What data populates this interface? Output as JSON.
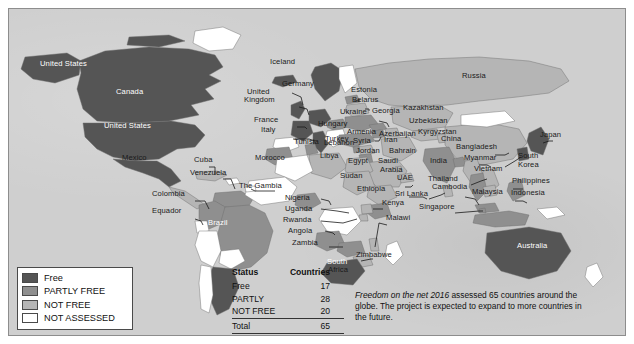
{
  "chart_data": {
    "type": "map",
    "title": "Freedom on the Net 2016",
    "subtitle": "Internet freedom status by country",
    "categories": [
      "Free",
      "PARTLY FREE",
      "NOT FREE",
      "NOT ASSESSED"
    ],
    "values": [
      17,
      28,
      20,
      null
    ],
    "total": 65,
    "legend_position": "bottom-left",
    "colors": {
      "free": "#555555",
      "partly_free": "#8f8f8f",
      "not_free": "#b5b5b5",
      "not_assessed": "#ffffff",
      "ocean": "#cfcfcf",
      "border": "#6e6e6e",
      "text": "#1a1a1a"
    },
    "series": [
      {
        "name": "Free",
        "value": 17,
        "color": "#555555"
      },
      {
        "name": "PARTLY",
        "value": 28,
        "color": "#8f8f8f"
      },
      {
        "name": "NOT FREE",
        "value": 20,
        "color": "#b5b5b5"
      }
    ]
  },
  "legend": {
    "items": [
      {
        "label": "Free",
        "color": "#555555"
      },
      {
        "label": "PARTLY FREE",
        "color": "#8f8f8f"
      },
      {
        "label": "NOT FREE",
        "color": "#b5b5b5"
      },
      {
        "label": "NOT ASSESSED",
        "color": "#ffffff"
      }
    ]
  },
  "table": {
    "headers": [
      "Status",
      "Countries"
    ],
    "rows": [
      {
        "status": "Free",
        "countries": "17"
      },
      {
        "status": "PARTLY",
        "countries": "28"
      },
      {
        "status": "NOT FREE",
        "countries": "20"
      }
    ],
    "total_label": "Total",
    "total_value": "65"
  },
  "caption": {
    "emphasis": "Freedom on the net 2016",
    "rest": " assessed 65 countries around the globe. The project is expected to expand to more countries in the future."
  },
  "map_labels": [
    {
      "id": "alaska",
      "text": "United States",
      "x": 40,
      "y": 60,
      "style": "light"
    },
    {
      "id": "canada",
      "text": "Canada",
      "x": 116,
      "y": 88,
      "style": "light"
    },
    {
      "id": "usa",
      "text": "United States",
      "x": 104,
      "y": 122,
      "style": "light"
    },
    {
      "id": "mexico",
      "text": "Mexico",
      "x": 122,
      "y": 154,
      "style": "dark"
    },
    {
      "id": "cuba",
      "text": "Cuba",
      "x": 194,
      "y": 156,
      "style": "dark"
    },
    {
      "id": "venezuela",
      "text": "Venezuela",
      "x": 190,
      "y": 169,
      "style": "dark"
    },
    {
      "id": "colombia",
      "text": "Colombia",
      "x": 152,
      "y": 190,
      "style": "dark"
    },
    {
      "id": "equador",
      "text": "Equador",
      "x": 152,
      "y": 207,
      "style": "dark"
    },
    {
      "id": "brazil",
      "text": "Brazil",
      "x": 208,
      "y": 219,
      "style": "light"
    },
    {
      "id": "iceland",
      "text": "Iceland",
      "x": 270,
      "y": 58,
      "style": "dark"
    },
    {
      "id": "germany",
      "text": "Germany",
      "x": 282,
      "y": 80,
      "style": "dark"
    },
    {
      "id": "unitedkingdom",
      "text": "United",
      "x": 247,
      "y": 88,
      "style": "dark"
    },
    {
      "id": "unitedkingdom2",
      "text": "Kingdom",
      "x": 244,
      "y": 96,
      "style": "dark"
    },
    {
      "id": "france",
      "text": "France",
      "x": 254,
      "y": 116,
      "style": "dark"
    },
    {
      "id": "italy",
      "text": "Italy",
      "x": 261,
      "y": 126,
      "style": "dark"
    },
    {
      "id": "estonia",
      "text": "Estonia",
      "x": 351,
      "y": 86,
      "style": "dark"
    },
    {
      "id": "belarus",
      "text": "Belarus",
      "x": 352,
      "y": 96,
      "style": "dark"
    },
    {
      "id": "ukraine",
      "text": "Ukraine",
      "x": 340,
      "y": 108,
      "style": "dark"
    },
    {
      "id": "georgia",
      "text": "Georgia",
      "x": 372,
      "y": 107,
      "style": "dark"
    },
    {
      "id": "kazakhstan",
      "text": "Kazakhstan",
      "x": 403,
      "y": 104,
      "style": "dark"
    },
    {
      "id": "uzbekistan",
      "text": "Uzbekistan",
      "x": 409,
      "y": 117,
      "style": "dark"
    },
    {
      "id": "kyrgyzstan",
      "text": "Kyrgyzstan",
      "x": 418,
      "y": 128,
      "style": "dark"
    },
    {
      "id": "hungary",
      "text": "Hungary",
      "x": 318,
      "y": 120,
      "style": "dark"
    },
    {
      "id": "armenia",
      "text": "Armenia",
      "x": 347,
      "y": 128,
      "style": "dark"
    },
    {
      "id": "azerbaijan",
      "text": "Azerbaijan",
      "x": 379,
      "y": 130,
      "style": "dark"
    },
    {
      "id": "turkey",
      "text": "Turkey",
      "x": 325,
      "y": 135,
      "style": "dark"
    },
    {
      "id": "syria",
      "text": "Syria",
      "x": 353,
      "y": 137,
      "style": "dark"
    },
    {
      "id": "iran",
      "text": "Iran",
      "x": 384,
      "y": 136,
      "style": "dark"
    },
    {
      "id": "tunisia",
      "text": "Tunisia",
      "x": 294,
      "y": 138,
      "style": "dark"
    },
    {
      "id": "lebanon",
      "text": "Lebanon",
      "x": 324,
      "y": 139,
      "style": "dark"
    },
    {
      "id": "jordan",
      "text": "Jordan",
      "x": 356,
      "y": 147,
      "style": "dark"
    },
    {
      "id": "bahrain",
      "text": "Bahrain",
      "x": 389,
      "y": 147,
      "style": "dark"
    },
    {
      "id": "libya",
      "text": "Libya",
      "x": 320,
      "y": 152,
      "style": "dark"
    },
    {
      "id": "morocco",
      "text": "Morocco",
      "x": 255,
      "y": 154,
      "style": "dark"
    },
    {
      "id": "egypt",
      "text": "Egypt",
      "x": 348,
      "y": 157,
      "style": "dark"
    },
    {
      "id": "saudi",
      "text": "Saudi",
      "x": 378,
      "y": 157,
      "style": "dark"
    },
    {
      "id": "arabia",
      "text": "Arabia",
      "x": 380,
      "y": 166,
      "style": "dark"
    },
    {
      "id": "uae",
      "text": "UAE",
      "x": 397,
      "y": 174,
      "style": "dark"
    },
    {
      "id": "india",
      "text": "India",
      "x": 430,
      "y": 157,
      "style": "dark"
    },
    {
      "id": "thegambia",
      "text": "The Gambia",
      "x": 239,
      "y": 182,
      "style": "dark"
    },
    {
      "id": "sudan",
      "text": "Sudan",
      "x": 340,
      "y": 172,
      "style": "dark"
    },
    {
      "id": "ethiopia",
      "text": "Ethiopia",
      "x": 357,
      "y": 185,
      "style": "dark"
    },
    {
      "id": "srilanka",
      "text": "Sri Lanka",
      "x": 395,
      "y": 190,
      "style": "dark"
    },
    {
      "id": "nigeria",
      "text": "Nigeria",
      "x": 285,
      "y": 194,
      "style": "dark"
    },
    {
      "id": "uganda",
      "text": "Uganda",
      "x": 285,
      "y": 205,
      "style": "dark"
    },
    {
      "id": "kenya",
      "text": "Kenya",
      "x": 382,
      "y": 199,
      "style": "dark"
    },
    {
      "id": "rwanda",
      "text": "Rwanda",
      "x": 283,
      "y": 216,
      "style": "dark"
    },
    {
      "id": "angola",
      "text": "Angola",
      "x": 288,
      "y": 227,
      "style": "dark"
    },
    {
      "id": "malawi",
      "text": "Malawi",
      "x": 386,
      "y": 214,
      "style": "dark"
    },
    {
      "id": "zambia",
      "text": "Zambia",
      "x": 292,
      "y": 239,
      "style": "dark"
    },
    {
      "id": "zimbabwe",
      "text": "Zimbabwe",
      "x": 356,
      "y": 251,
      "style": "dark"
    },
    {
      "id": "southafrica",
      "text": "South",
      "x": 327,
      "y": 258,
      "style": "light"
    },
    {
      "id": "southafrica2",
      "text": "Africa",
      "x": 328,
      "y": 266,
      "style": "dark"
    },
    {
      "id": "russia",
      "text": "Russia",
      "x": 462,
      "y": 72,
      "style": "dark"
    },
    {
      "id": "china",
      "text": "China",
      "x": 441,
      "y": 135,
      "style": "dark"
    },
    {
      "id": "japan",
      "text": "Japan",
      "x": 540,
      "y": 131,
      "style": "dark"
    },
    {
      "id": "bangladesh",
      "text": "Bangladesh",
      "x": 456,
      "y": 143,
      "style": "dark"
    },
    {
      "id": "myanmar",
      "text": "Myanmar",
      "x": 464,
      "y": 154,
      "style": "dark"
    },
    {
      "id": "southkorea",
      "text": "South",
      "x": 518,
      "y": 152,
      "style": "dark"
    },
    {
      "id": "southkorea2",
      "text": "Korea",
      "x": 518,
      "y": 161,
      "style": "dark"
    },
    {
      "id": "vietnam",
      "text": "Vietnam",
      "x": 474,
      "y": 165,
      "style": "dark"
    },
    {
      "id": "thailand",
      "text": "Thailand",
      "x": 428,
      "y": 175,
      "style": "dark"
    },
    {
      "id": "cambodia",
      "text": "Cambodia",
      "x": 432,
      "y": 183,
      "style": "dark"
    },
    {
      "id": "philippines",
      "text": "Philippines",
      "x": 512,
      "y": 177,
      "style": "dark"
    },
    {
      "id": "malaysia",
      "text": "Malaysia",
      "x": 472,
      "y": 188,
      "style": "dark"
    },
    {
      "id": "indonesia",
      "text": "Indonesia",
      "x": 511,
      "y": 189,
      "style": "dark"
    },
    {
      "id": "singapore",
      "text": "Singapore",
      "x": 419,
      "y": 203,
      "style": "dark"
    },
    {
      "id": "australia",
      "text": "Australia",
      "x": 517,
      "y": 242,
      "style": "light"
    }
  ]
}
